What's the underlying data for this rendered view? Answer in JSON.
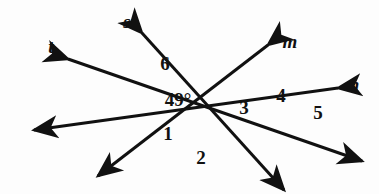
{
  "figure": {
    "title": "Four intersecting lines with numbered angles",
    "background_color": "#fdfdfd",
    "stroke_color": "#111111",
    "stroke_width": 3,
    "width": 379,
    "height": 194,
    "line_labels": [
      {
        "id": "s",
        "text": "s",
        "x": 127,
        "y": 21
      },
      {
        "id": "t",
        "text": "t",
        "x": 51,
        "y": 46
      },
      {
        "id": "m",
        "text": "m",
        "x": 290,
        "y": 41
      },
      {
        "id": "n",
        "text": "n",
        "x": 354,
        "y": 84
      }
    ],
    "angle_labels": [
      {
        "id": "angle-6",
        "text": "6",
        "x": 165,
        "y": 63
      },
      {
        "id": "angle-49",
        "text": "49°",
        "x": 178,
        "y": 99
      },
      {
        "id": "angle-3",
        "text": "3",
        "x": 244,
        "y": 107
      },
      {
        "id": "angle-4",
        "text": "4",
        "x": 281,
        "y": 95
      },
      {
        "id": "angle-5",
        "text": "5",
        "x": 318,
        "y": 112
      },
      {
        "id": "angle-1",
        "text": "1",
        "x": 168,
        "y": 133
      },
      {
        "id": "angle-2",
        "text": "2",
        "x": 201,
        "y": 157
      }
    ],
    "lines": [
      {
        "id": "line-t",
        "name": "line-t",
        "x1": 68,
        "y1": 59,
        "x2": 362,
        "y2": 161,
        "arrow_start": true,
        "arrow_end": true
      },
      {
        "id": "line-s",
        "name": "line-s",
        "x1": 142,
        "y1": 33,
        "x2": 284,
        "y2": 190,
        "arrow_start": true,
        "arrow_end": true
      },
      {
        "id": "line-m",
        "name": "line-m",
        "x1": 268,
        "y1": 45,
        "x2": 98,
        "y2": 176,
        "arrow_start": true,
        "arrow_end": true
      },
      {
        "id": "line-n",
        "name": "line-n",
        "x1": 338,
        "y1": 88,
        "x2": 34,
        "y2": 130,
        "arrow_start": true,
        "arrow_end": true
      }
    ],
    "intersections": [
      {
        "id": "t-s",
        "x": 128,
        "y": 97
      },
      {
        "id": "s-m",
        "x": 208,
        "y": 67
      },
      {
        "id": "t-n",
        "x": 201,
        "y": 141
      },
      {
        "id": "m-n",
        "x": 281,
        "y": 109
      }
    ]
  }
}
